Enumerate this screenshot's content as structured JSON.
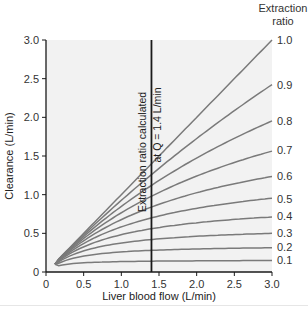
{
  "chart_data": {
    "type": "line",
    "title": "",
    "xlabel": "Liver blood flow (L/min)",
    "ylabel": "Clearance (L/min)",
    "xlim": [
      0,
      3.0
    ],
    "ylim": [
      0,
      3.0
    ],
    "x_ticks": [
      "0",
      "0.5",
      "1.0",
      "1.5",
      "2.0",
      "2.5",
      "3.0"
    ],
    "x_tick_values": [
      0,
      0.5,
      1.0,
      1.5,
      2.0,
      2.5,
      3.0
    ],
    "y_ticks": [
      "0",
      "0.5",
      "1.0",
      "1.5",
      "2.0",
      "2.5",
      "3.0"
    ],
    "y_tick_values": [
      0,
      0.5,
      1.0,
      1.5,
      2.0,
      2.5,
      3.0
    ],
    "grid": false,
    "legend_title": [
      "Extraction",
      "ratio"
    ],
    "legend_position": "right, inline at curve ends",
    "model_note": "Clearance = Q * CLint / (Q + CLint), with CLint chosen so extraction ratio = E at Q = 1.4 L/min",
    "reference_flow": 1.4,
    "x": [
      0.12,
      0.25,
      0.5,
      0.75,
      1.0,
      1.25,
      1.4,
      1.5,
      1.75,
      2.0,
      2.25,
      2.5,
      2.75,
      3.0
    ],
    "series": [
      {
        "name": "1.0",
        "values": [
          0.12,
          0.25,
          0.5,
          0.75,
          1.0,
          1.25,
          1.4,
          1.5,
          1.75,
          2.0,
          2.25,
          2.5,
          2.75,
          3.0
        ]
      },
      {
        "name": "0.9",
        "values": [
          0.12,
          0.25,
          0.48,
          0.71,
          0.93,
          1.15,
          1.26,
          1.34,
          1.53,
          1.72,
          1.9,
          2.08,
          2.25,
          2.42
        ]
      },
      {
        "name": "0.8",
        "values": [
          0.11,
          0.24,
          0.46,
          0.66,
          0.85,
          1.02,
          1.12,
          1.18,
          1.33,
          1.47,
          1.6,
          1.72,
          1.84,
          1.95
        ]
      },
      {
        "name": "0.7",
        "values": [
          0.11,
          0.23,
          0.43,
          0.61,
          0.77,
          0.91,
          0.98,
          1.03,
          1.14,
          1.24,
          1.34,
          1.42,
          1.5,
          1.58
        ]
      },
      {
        "name": "0.6",
        "values": [
          0.11,
          0.22,
          0.4,
          0.55,
          0.68,
          0.79,
          0.84,
          0.87,
          0.95,
          1.02,
          1.09,
          1.14,
          1.19,
          1.24
        ]
      },
      {
        "name": "0.5",
        "values": [
          0.11,
          0.21,
          0.37,
          0.49,
          0.58,
          0.66,
          0.7,
          0.72,
          0.78,
          0.82,
          0.86,
          0.9,
          0.93,
          0.95
        ]
      },
      {
        "name": "0.4",
        "values": [
          0.11,
          0.19,
          0.32,
          0.41,
          0.48,
          0.53,
          0.56,
          0.57,
          0.61,
          0.64,
          0.66,
          0.68,
          0.7,
          0.72
        ]
      },
      {
        "name": "0.3",
        "values": [
          0.09,
          0.16,
          0.23,
          0.3,
          0.35,
          0.39,
          0.42,
          0.43,
          0.45,
          0.47,
          0.48,
          0.49,
          0.5,
          0.51
        ]
      },
      {
        "name": "0.2",
        "values": [
          0.09,
          0.13,
          0.18,
          0.21,
          0.24,
          0.26,
          0.28,
          0.28,
          0.29,
          0.3,
          0.31,
          0.31,
          0.32,
          0.32
        ]
      },
      {
        "name": "0.1",
        "values": [
          0.08,
          0.09,
          0.1,
          0.12,
          0.13,
          0.14,
          0.14,
          0.14,
          0.15,
          0.15,
          0.15,
          0.15,
          0.16,
          0.16
        ]
      }
    ],
    "annotations": [
      {
        "text": "Extraction ratio calculated",
        "orientation": "vertical",
        "side": "left of reference line"
      },
      {
        "text": "at Q̇ = 1.4 L/min",
        "orientation": "vertical",
        "side": "right of reference line"
      }
    ],
    "reference_line": {
      "x": 1.4,
      "type": "vertical",
      "color": "#1a1a1a"
    }
  },
  "labels": {
    "legend_line1": "Extraction",
    "legend_line2": "ratio",
    "annotation_left": "Extraction ratio calculated",
    "annotation_right": "at Q̇ = 1.4 L/min",
    "xlabel": "Liver blood flow (L/min)",
    "ylabel": "Clearance (L/min)"
  },
  "colors": {
    "plot_background": "#f2f2f2",
    "curve": "#7a7a7a",
    "axis": "#1a1a1a",
    "reference_line": "#1a1a1a",
    "text": "#333333"
  }
}
